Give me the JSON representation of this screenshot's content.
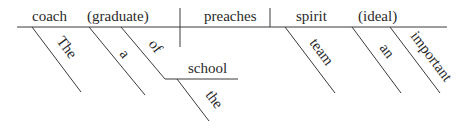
{
  "diagram": {
    "type": "Reed-Kellogg sentence diagram",
    "baseline": {
      "subject": "coach",
      "subject_appositive": "(graduate)",
      "predicate": "preaches",
      "object": "spirit",
      "object_appositive": "(ideal)"
    },
    "modifiers": {
      "subject_article": "The",
      "appositive_article": "a",
      "preposition": "of",
      "prep_object": "school",
      "prep_object_article": "the",
      "object_adjective": "team",
      "ideal_article": "an",
      "ideal_adjective": "important"
    }
  }
}
